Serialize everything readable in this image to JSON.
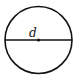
{
  "diagram": {
    "shape": "circle",
    "label": "d",
    "label_meaning": "diameter",
    "stroke_color": "#111111",
    "background": "#ffffff",
    "elements": [
      "circle-outline",
      "diameter-line",
      "center-point",
      "diameter-label"
    ]
  }
}
